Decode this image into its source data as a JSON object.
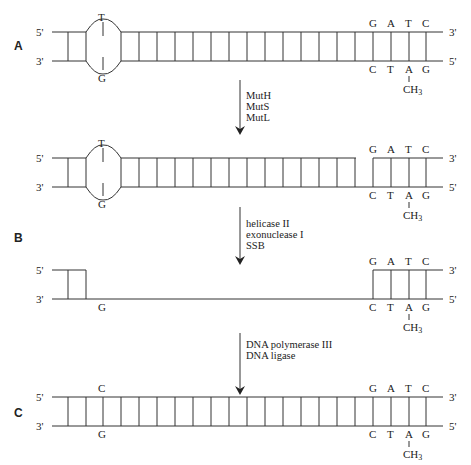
{
  "panels": {
    "A": {
      "label": "A"
    },
    "B": {
      "label": "B"
    },
    "C": {
      "label": "C"
    }
  },
  "strand_ends": {
    "five_prime": "5'",
    "three_prime": "3'"
  },
  "mismatch": {
    "top_base": "T",
    "bottom_base": "G",
    "repaired_top_base": "C",
    "repaired_bottom_base": "G"
  },
  "gatc_site": {
    "top": [
      "G",
      "A",
      "T",
      "C"
    ],
    "bottom": [
      "C",
      "T",
      "A",
      "G"
    ],
    "methyl_label": "CH",
    "methyl_subscript": "3"
  },
  "steps": [
    {
      "enzymes": [
        "MutH",
        "MutS",
        "MutL"
      ]
    },
    {
      "enzymes": [
        "helicase II",
        "exonuclease I",
        "SSB"
      ]
    },
    {
      "enzymes": [
        "DNA polymerase III",
        "DNA ligase"
      ]
    }
  ]
}
